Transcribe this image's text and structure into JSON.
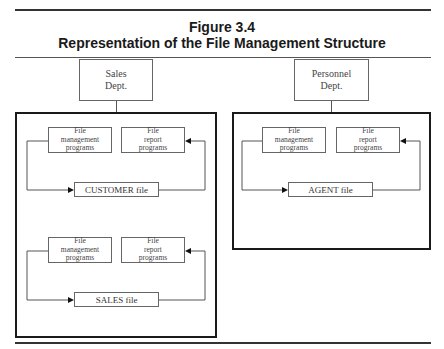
{
  "figure": {
    "number": "Figure 3.4",
    "title": "Representation of the File Management Structure"
  },
  "departments": [
    {
      "name_line1": "Sales",
      "name_line2": "Dept.",
      "groups": [
        {
          "programs": [
            {
              "line1": "File",
              "line2": "management",
              "line3": "programs"
            },
            {
              "line1": "File",
              "line2": "report",
              "line3": "programs"
            }
          ],
          "file": "CUSTOMER file"
        },
        {
          "programs": [
            {
              "line1": "File",
              "line2": "management",
              "line3": "programs"
            },
            {
              "line1": "File",
              "line2": "report",
              "line3": "programs"
            }
          ],
          "file": "SALES file"
        }
      ]
    },
    {
      "name_line1": "Personnel",
      "name_line2": "Dept.",
      "groups": [
        {
          "programs": [
            {
              "line1": "File",
              "line2": "management",
              "line3": "programs"
            },
            {
              "line1": "File",
              "line2": "report",
              "line3": "programs"
            }
          ],
          "file": "AGENT file"
        }
      ]
    }
  ],
  "colors": {
    "rule": "#333333",
    "box_border": "#666666",
    "container_border": "#1a1a1a"
  }
}
